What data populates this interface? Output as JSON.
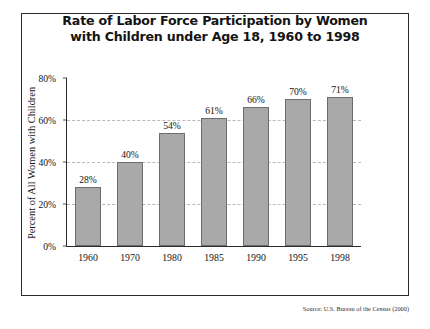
{
  "figure": {
    "title_lines": [
      "Rate of Labor Force Participation by Women",
      "with Children under Age 18, 1960 to 1998"
    ],
    "source_note": "Source: U.S. Bureau of the Census (2000)",
    "bar_color": "#a9a9a9",
    "bar_border_color": "#6d6d6d",
    "frame_color": "#2b2b2b",
    "gridline_color": "#b9b9b9"
  },
  "chart_data": {
    "type": "bar",
    "title": "Rate of Labor Force Participation by Women with Children under Age 18, 1960 to 1998",
    "xlabel": "",
    "ylabel": "Percent of All Women with Children",
    "categories": [
      "1960",
      "1970",
      "1980",
      "1985",
      "1990",
      "1995",
      "1998"
    ],
    "values": [
      28,
      40,
      54,
      61,
      66,
      70,
      71
    ],
    "data_labels": [
      "28%",
      "40%",
      "54%",
      "61%",
      "66%",
      "70%",
      "71%"
    ],
    "ylim": [
      0,
      80
    ],
    "yticks": [
      0,
      20,
      40,
      60,
      80
    ],
    "ytick_labels": [
      "0%",
      "20%",
      "40%",
      "60%",
      "80%"
    ],
    "gridlines_at": [
      20,
      40,
      60
    ],
    "grid": true,
    "legend": null,
    "source": "U.S. Bureau of the Census (2000)"
  }
}
